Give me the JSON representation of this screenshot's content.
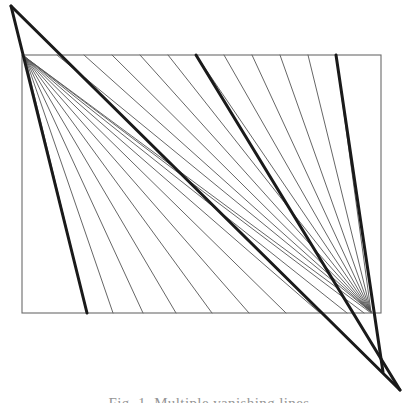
{
  "figure": {
    "caption": "Fig. 1. Multiple vanishing lines",
    "background_color": "#ffffff",
    "ink_color": "#1a1a1a",
    "thin_line_color": "#555555",
    "frame_color": "#6b6b6b",
    "thin_line_width": 0.9,
    "bold_line_width": 3.0,
    "frame_line_width": 1.1,
    "canvas": {
      "width": 418,
      "height": 403
    },
    "rectangle": {
      "label": "picture-plane-rectangle",
      "left": 22,
      "top": 55,
      "right": 381,
      "bottom": 313
    },
    "hubs": [
      {
        "name": "left-hub",
        "x": 25,
        "y": 57
      },
      {
        "name": "right-hub",
        "x": 371,
        "y": 312
      }
    ],
    "apexes": [
      {
        "name": "top-left-apex",
        "x": 11,
        "y": 6
      },
      {
        "name": "bottom-right-apex",
        "x": 400,
        "y": 390
      }
    ],
    "left_fan": {
      "name": "left-fan-lines",
      "count": 11,
      "from": {
        "x": 25,
        "y": 57
      },
      "to_x": [
        87,
        113,
        143,
        176,
        212,
        249,
        286,
        320,
        347,
        364,
        371
      ],
      "to_y": 313
    },
    "right_fan": {
      "name": "right-fan-lines",
      "count": 11,
      "from": {
        "x": 371,
        "y": 312
      },
      "from_x": [
        57,
        84,
        112,
        140,
        168,
        196,
        224,
        252,
        280,
        308,
        336
      ],
      "from_y": 55
    },
    "bold_lines": [
      {
        "name": "bold-line-left-diagonal",
        "x1": 11,
        "y1": 6,
        "x2": 87,
        "y2": 313
      },
      {
        "name": "bold-line-main-diagonal",
        "x1": 11,
        "y1": 6,
        "x2": 400,
        "y2": 390
      },
      {
        "name": "bold-line-mid-fan",
        "x1": 196,
        "y1": 55,
        "x2": 400,
        "y2": 390
      },
      {
        "name": "bold-line-right-fan",
        "x1": 336,
        "y1": 55,
        "x2": 383,
        "y2": 372
      }
    ]
  }
}
